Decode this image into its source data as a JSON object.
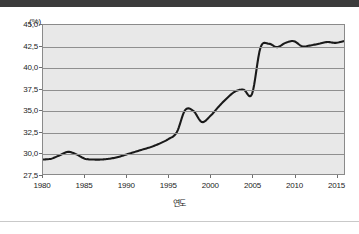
{
  "chart_data": {
    "type": "line",
    "title": "",
    "subtitle": "",
    "xlabel": "연도",
    "ylabel": "",
    "unit_label": "(%)",
    "xlim": [
      1980,
      2016
    ],
    "ylim": [
      27.5,
      45.0
    ],
    "grid": true,
    "legend": "none",
    "decimal_separator": ",",
    "y_ticks": [
      "45,0",
      "42,5",
      "40,0",
      "37,5",
      "35,0",
      "32,5",
      "30,0",
      "27,5"
    ],
    "y_tick_values": [
      45.0,
      42.5,
      40.0,
      37.5,
      35.0,
      32.5,
      30.0,
      27.5
    ],
    "x_ticks": [
      "1980",
      "1985",
      "1990",
      "1995",
      "2000",
      "2005",
      "2010",
      "2015"
    ],
    "x_tick_values": [
      1980,
      1985,
      1990,
      1995,
      2000,
      2005,
      2010,
      2015
    ],
    "series": [
      {
        "name": "비율",
        "color": "#1a1a1a",
        "x": [
          1980,
          1981,
          1982,
          1983,
          1984,
          1985,
          1986,
          1987,
          1988,
          1989,
          1990,
          1991,
          1992,
          1993,
          1994,
          1995,
          1996,
          1997,
          1998,
          1999,
          2000,
          2001,
          2002,
          2003,
          2004,
          2005,
          2006,
          2007,
          2008,
          2009,
          2010,
          2011,
          2012,
          2013,
          2014,
          2015,
          2016
        ],
        "values": [
          29.2,
          29.3,
          29.7,
          30.1,
          29.8,
          29.3,
          29.2,
          29.2,
          29.3,
          29.5,
          29.8,
          30.1,
          30.4,
          30.7,
          31.1,
          31.6,
          32.4,
          35.0,
          34.9,
          33.6,
          34.3,
          35.4,
          36.4,
          37.2,
          37.4,
          36.9,
          42.3,
          42.8,
          42.4,
          42.9,
          43.1,
          42.5,
          42.6,
          42.8,
          43.0,
          42.9,
          43.1
        ]
      }
    ],
    "annotations": []
  }
}
